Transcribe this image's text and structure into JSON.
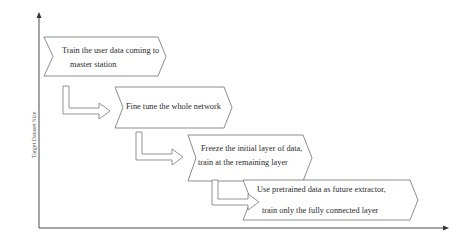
{
  "diagram": {
    "type": "staircase-flow",
    "y_axis_label": "Target Dataset Size",
    "x_axis_label": "",
    "steps": [
      {
        "line1": "Train the user data coming to",
        "line2": "master station"
      },
      {
        "line1": "Fine tune the whole network",
        "line2": ""
      },
      {
        "line1": "Freeze the initial layer of data,",
        "line2": "train at the remaining layer"
      },
      {
        "line1": "Use pretrained data as future extractor,",
        "line2": "train only the fully connected layer"
      }
    ],
    "colors": {
      "stroke": "#6e6e6e",
      "axis": "#4a4a4a",
      "text": "#2a2a2a"
    }
  }
}
